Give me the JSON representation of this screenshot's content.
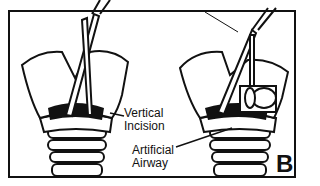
{
  "figure": {
    "panel_letter": "B",
    "labels": {
      "vertical_incision": [
        "Vertical",
        "Incision"
      ],
      "artificial_airway": [
        "Artificial",
        "Airway"
      ]
    },
    "panels": [
      {
        "name": "left-panel",
        "depicts": "scissors inserted through vertical incision in larynx"
      },
      {
        "name": "right-panel",
        "depicts": "artificial airway inserted beside scissors"
      }
    ]
  }
}
